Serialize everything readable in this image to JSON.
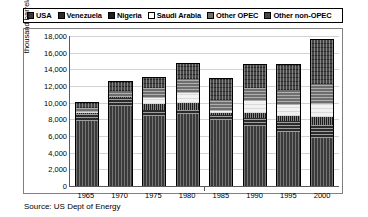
{
  "legend": {
    "items": [
      {
        "label": "USA",
        "key": "usa"
      },
      {
        "label": "Venezuela",
        "key": "venezuela"
      },
      {
        "label": "Nigeria",
        "key": "nigeria"
      },
      {
        "label": "Saudi Arabia",
        "key": "saudi"
      },
      {
        "label": "Other OPEC",
        "key": "other-opec"
      },
      {
        "label": "Other non-OPEC",
        "key": "other-non-opec"
      }
    ]
  },
  "source": {
    "text": "Source: US Dept of Energy"
  },
  "chart_data": {
    "type": "bar",
    "variant": "stacked",
    "title": "",
    "xlabel": "",
    "ylabel": "thousand barrel/day",
    "ylim": [
      0,
      18000
    ],
    "ytick_step": 2000,
    "ytick_labels": [
      "18,000",
      "16,000",
      "14,000",
      "12,000",
      "10,000",
      "8,000",
      "6,000",
      "4,000",
      "2,000",
      "0"
    ],
    "ytick_values": [
      18000,
      16000,
      14000,
      12000,
      10000,
      8000,
      6000,
      4000,
      2000,
      0
    ],
    "grid": true,
    "legend_position": "top",
    "categories": [
      "1965",
      "1970",
      "1975",
      "1980",
      "1985",
      "1990",
      "1995",
      "2000"
    ],
    "series": [
      {
        "name": "USA",
        "key": "usa",
        "values": [
          7800,
          9600,
          8400,
          8600,
          7900,
          7200,
          6500,
          5800
        ]
      },
      {
        "name": "Venezuela",
        "key": "venezuela",
        "values": [
          900,
          1000,
          700,
          500,
          600,
          1000,
          1300,
          1550
        ]
      },
      {
        "name": "Nigeria",
        "key": "nigeria",
        "values": [
          60,
          50,
          760,
          860,
          300,
          620,
          630,
          900
        ]
      },
      {
        "name": "Saudi Arabia",
        "key": "saudi",
        "values": [
          170,
          30,
          700,
          1260,
          170,
          1340,
          1340,
          1570
        ]
      },
      {
        "name": "Other OPEC",
        "key": "other-opec",
        "values": [
          450,
          740,
          1150,
          1600,
          1350,
          1640,
          1700,
          2400
        ]
      },
      {
        "name": "Other non-OPEC",
        "key": "other-non-opec",
        "values": [
          620,
          1080,
          1290,
          1880,
          2480,
          2700,
          3030,
          5280
        ]
      }
    ],
    "totals": [
      10000,
      12500,
      13000,
      14700,
      12800,
      14500,
      14500,
      17500
    ]
  }
}
